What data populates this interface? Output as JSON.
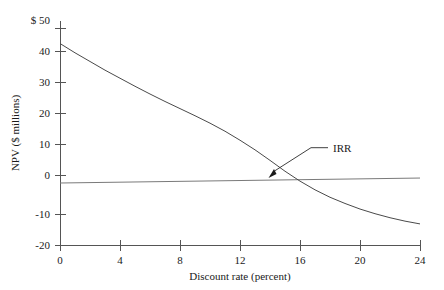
{
  "chart_data": {
    "type": "line",
    "title": "",
    "xlabel": "Discount rate (percent)",
    "ylabel": "NPV ($ millions)",
    "xlim": [
      0,
      24
    ],
    "ylim": [
      -20,
      50
    ],
    "grid": false,
    "legend": null,
    "x_ticks": [
      0,
      4,
      8,
      12,
      16,
      20,
      24
    ],
    "x_tick_labels": [
      "0",
      "4",
      "8",
      "12",
      "16",
      "20",
      "24"
    ],
    "y_ticks": [
      -20,
      -10,
      0,
      10,
      20,
      30,
      40,
      50
    ],
    "y_tick_labels": [
      "-20",
      "-10",
      "0",
      "10",
      "20",
      "30",
      "40",
      "$ 50"
    ],
    "series": [
      {
        "name": "NPV profile",
        "x": [
          0,
          1,
          2,
          3,
          4,
          5,
          6,
          7,
          8,
          9,
          10,
          11,
          12,
          13,
          14,
          15,
          16,
          17,
          18,
          19,
          20,
          21,
          22,
          23,
          24
        ],
        "values": [
          45.0,
          42.0,
          39.2,
          36.4,
          33.8,
          31.2,
          28.7,
          26.3,
          24.0,
          21.7,
          19.3,
          16.7,
          13.8,
          10.7,
          7.3,
          3.8,
          0.6,
          -2.2,
          -4.6,
          -6.6,
          -8.4,
          -9.9,
          -11.2,
          -12.3,
          -13.2
        ]
      },
      {
        "name": "Zero reference line",
        "x": [
          0,
          24
        ],
        "values": [
          0.0,
          1.6
        ]
      }
    ],
    "annotations": [
      {
        "label": "IRR",
        "points_to_x": 13.7,
        "points_to_y": 0.0,
        "label_x": 18.2,
        "label_y": 11.4
      }
    ]
  }
}
